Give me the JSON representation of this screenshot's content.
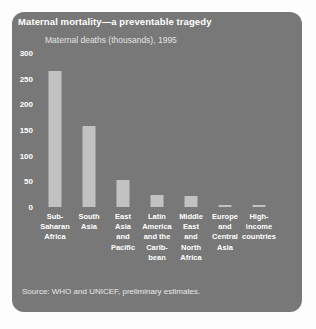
{
  "chart_data": {
    "type": "bar",
    "title": "Maternal mortality—a preventable tragedy",
    "subtitle": "Maternal deaths (thousands), 1995",
    "source": "Source: WHO and UNICEF, preliminary estimates.",
    "xlabel": "",
    "ylabel": "Maternal deaths (thousands)",
    "ylim": [
      0,
      300
    ],
    "yticks": [
      300,
      250,
      200,
      150,
      100,
      50,
      0
    ],
    "grid": false,
    "legend": false,
    "categories": [
      "Sub-Saharan Africa",
      "South Asia",
      "East Asia and Pacific",
      "Latin America and the Carib-bean",
      "Middle East and North Africa",
      "Europe and Central Asia",
      "High-income countries"
    ],
    "category_lines": [
      "Sub-\nSaharan\nAfrica",
      "South\nAsia",
      "East\nAsia\nand\nPacific",
      "Latin\nAmerica\nand the\nCarib-\nbean",
      "Middle\nEast\nand\nNorth\nAfrica",
      "Europe\nand\nCentral\nAsia",
      "High-\nincome\ncountries"
    ],
    "values": [
      265,
      158,
      53,
      23,
      22,
      3,
      3
    ],
    "colors": {
      "card_background": "#787878",
      "page_background": "#fdfdfd",
      "bar": "#c2c2c2",
      "title_text": "#ffffff",
      "subtitle_text": "#e2e2e2",
      "tick_text": "#ffffff",
      "source_text": "#e8e8e8"
    }
  }
}
